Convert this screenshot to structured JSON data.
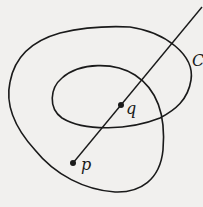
{
  "diagram": {
    "labels": {
      "curve": "C",
      "point_p": "p",
      "point_q": "q"
    },
    "colors": {
      "background": "#f1f0ee",
      "ink": "#1a1a1a"
    }
  }
}
